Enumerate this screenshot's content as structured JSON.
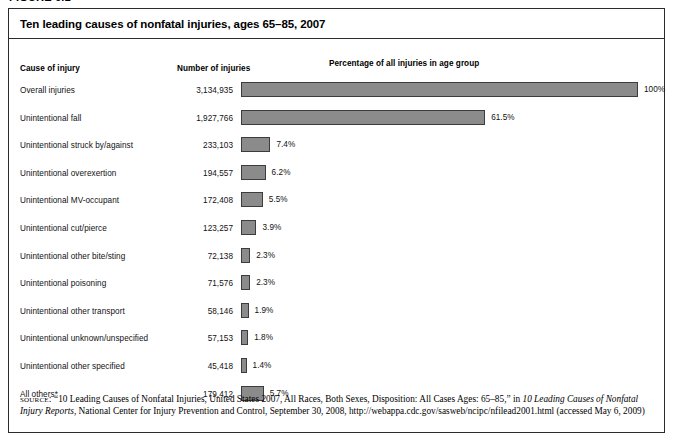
{
  "figure": {
    "label": "FIGURE 6.1"
  },
  "panel": {
    "title": "Ten leading causes of nonfatal injuries, ages 65–85, 2007",
    "headers": {
      "cause": "Cause of injury",
      "number": "Number of injuries",
      "percentage": "Percentage of all injuries in age group"
    }
  },
  "chart_data": {
    "type": "bar",
    "title": "Ten leading causes of nonfatal injuries, ages 65–85, 2007",
    "xlabel": "Percentage of all injuries in age group",
    "ylabel": "Cause of injury",
    "orientation": "horizontal",
    "grid": false,
    "legend": null,
    "xlim": [
      0,
      100
    ],
    "categories": [
      "Overall injuries",
      "Unintentional fall",
      "Unintentional struck by/against",
      "Unintentional overexertion",
      "Unintentional MV-occupant",
      "Unintentional cut/pierce",
      "Unintentional other bite/sting",
      "Unintentional poisoning",
      "Unintentional other transport",
      "Unintentional unknown/unspecified",
      "Unintentional other specified",
      "All others*"
    ],
    "values": [
      100,
      61.5,
      7.4,
      6.2,
      5.5,
      3.9,
      2.3,
      2.3,
      1.9,
      1.8,
      1.4,
      5.7
    ],
    "counts": [
      3134935,
      1927766,
      233103,
      194557,
      172408,
      123257,
      72138,
      71576,
      58146,
      57153,
      45418,
      179412
    ],
    "bar_color": "#8b8b8b",
    "bar_border_color": "#3c3c3c"
  },
  "rows": [
    {
      "cause": "Overall injuries",
      "number": "3,134,935",
      "percent_label": "100%",
      "percent": 100
    },
    {
      "cause": "Unintentional fall",
      "number": "1,927,766",
      "percent_label": "61.5%",
      "percent": 61.5
    },
    {
      "cause": "Unintentional struck by/against",
      "number": "233,103",
      "percent_label": "7.4%",
      "percent": 7.4
    },
    {
      "cause": "Unintentional overexertion",
      "number": "194,557",
      "percent_label": "6.2%",
      "percent": 6.2
    },
    {
      "cause": "Unintentional MV-occupant",
      "number": "172,408",
      "percent_label": "5.5%",
      "percent": 5.5
    },
    {
      "cause": "Unintentional cut/pierce",
      "number": "123,257",
      "percent_label": "3.9%",
      "percent": 3.9
    },
    {
      "cause": "Unintentional other bite/sting",
      "number": "72,138",
      "percent_label": "2.3%",
      "percent": 2.3
    },
    {
      "cause": "Unintentional poisoning",
      "number": "71,576",
      "percent_label": "2.3%",
      "percent": 2.3
    },
    {
      "cause": "Unintentional other transport",
      "number": "58,146",
      "percent_label": "1.9%",
      "percent": 1.9
    },
    {
      "cause": "Unintentional unknown/unspecified",
      "number": "57,153",
      "percent_label": "1.8%",
      "percent": 1.8
    },
    {
      "cause": "Unintentional other specified",
      "number": "45,418",
      "percent_label": "1.4%",
      "percent": 1.4
    },
    {
      "cause": "All others*",
      "number": "179,412",
      "percent_label": "5.7%",
      "percent": 5.7
    }
  ],
  "source": {
    "prefix": "source:",
    "part1": " “10 Leading Causes of Nonfatal Injuries, United States 2007, All Races, Both Sexes, Disposition: All Cases Ages: 65–85,” in ",
    "italic1": "10 Leading Causes of Nonfatal Injury Reports",
    "part2": ", National Center for Injury Prevention and Control, September 30, 2008, http://webappa.cdc.gov/sasweb/ncipc/nfilead2001.html (accessed May 6, 2009)"
  }
}
